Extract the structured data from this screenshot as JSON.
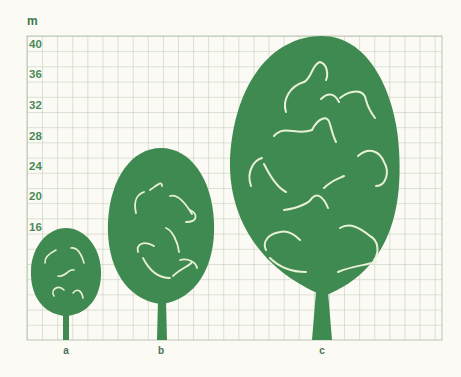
{
  "diagram": {
    "unit_label": "m",
    "y_axis": {
      "unit": "m",
      "ticks": [
        "40",
        "36",
        "32",
        "28",
        "24",
        "20",
        "16"
      ],
      "tick_values": [
        40,
        36,
        32,
        28,
        24,
        20,
        16
      ],
      "range": [
        0,
        40
      ]
    },
    "trees": [
      {
        "label": "a",
        "approx_height_m": 15
      },
      {
        "label": "b",
        "approx_height_m": 25
      },
      {
        "label": "c",
        "approx_height_m": 40
      }
    ],
    "colors": {
      "tree": "#3f8a50",
      "grid": "#b9c6b4",
      "background": "#fbfaf4",
      "highlight": "#e8f0d8",
      "tick_text": "#4a8a58"
    }
  }
}
